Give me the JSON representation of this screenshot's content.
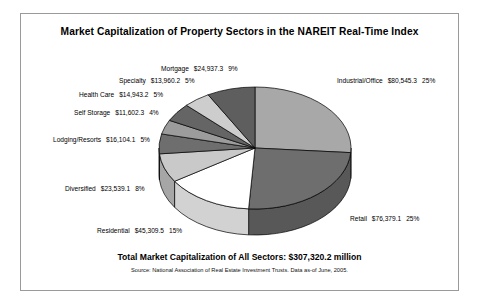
{
  "card": {
    "title": "Market Capitalization of Property Sectors in the NAREIT Real-Time Index",
    "total_line": "Total Market Capitalization of All Sectors:  $307,320.2 million",
    "source_line": "Source:  National Association of Real Estate Investment Trusts.  Data as-of June, 2005."
  },
  "chart_data": {
    "type": "pie",
    "title": "Market Capitalization of Property Sectors in the NAREIT Real-Time Index",
    "units": "$ millions",
    "total": 307320.2,
    "total_label": "$307,320.2 million",
    "legend_position": "callout-labels",
    "three_d": true,
    "start_angle_deg": 0,
    "direction": "clockwise",
    "categories": [
      "Industrial/Office",
      "Retail",
      "Residential",
      "Diversified",
      "Lodging/Resorts",
      "Self Storage",
      "Health Care",
      "Specialty",
      "Mortgage"
    ],
    "values": [
      80545.3,
      76379.1,
      45309.5,
      23539.1,
      16104.1,
      11602.3,
      14943.2,
      13960.2,
      24937.3
    ],
    "value_labels": [
      "$80,545.3",
      "$76,379.1",
      "$45,309.5",
      "$23,539.1",
      "$16,104.1",
      "$11,602.3",
      "$14,943.2",
      "$13,960.2",
      "$24,937.3"
    ],
    "percents": [
      25,
      25,
      15,
      8,
      5,
      4,
      5,
      5,
      9
    ],
    "percent_labels": [
      "25%",
      "25%",
      "15%",
      "8%",
      "5%",
      "4%",
      "5%",
      "5%",
      "9%"
    ],
    "colors": [
      "#a8a8a8",
      "#6e6e6e",
      "#ffffff",
      "#c9c9c9",
      "#6e6e6e",
      "#9c9c9c",
      "#656565",
      "#cdcdcd",
      "#5e5e5e"
    ],
    "side_colors": [
      "#8a8a8a",
      "#585858",
      "#d2d2d2",
      "#a6a6a6",
      "#585858",
      "#7e7e7e",
      "#515151",
      "#a9a9a9",
      "#4c4c4c"
    ]
  },
  "slices": [
    {
      "name": "Industrial/Office",
      "value": "$80,545.3",
      "percent": "25%"
    },
    {
      "name": "Retail",
      "value": "$76,379.1",
      "percent": "25%"
    },
    {
      "name": "Residential",
      "value": "$45,309.5",
      "percent": "15%"
    },
    {
      "name": "Diversified",
      "value": "$23,539.1",
      "percent": "8%"
    },
    {
      "name": "Lodging/Resorts",
      "value": "$16,104.1",
      "percent": "5%"
    },
    {
      "name": "Self Storage",
      "value": "$11,602.3",
      "percent": "4%"
    },
    {
      "name": "Health Care",
      "value": "$14,943.2",
      "percent": "5%"
    },
    {
      "name": "Specialty",
      "value": "$13,960.2",
      "percent": "5%"
    },
    {
      "name": "Mortgage",
      "value": "$24,937.3",
      "percent": "9%"
    }
  ]
}
